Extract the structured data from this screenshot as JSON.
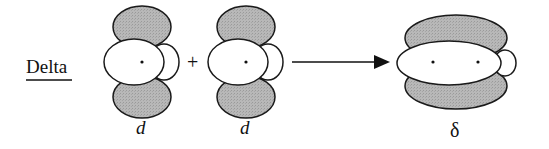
{
  "title": "Delta",
  "operator": "+",
  "orbitals": [
    {
      "label": "d",
      "type": "d-orbital"
    },
    {
      "label": "d",
      "type": "d-orbital"
    }
  ],
  "result": {
    "label": "δ",
    "type": "delta-bond"
  },
  "colors": {
    "lobe_shaded": "#b3b3b3",
    "lobe_white": "#ffffff",
    "outline": "#1a1a1a"
  }
}
